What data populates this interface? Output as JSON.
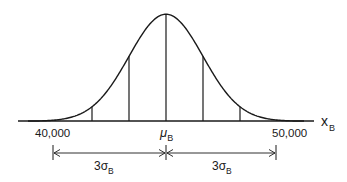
{
  "figure": {
    "type": "normal-distribution-diagram",
    "colors": {
      "stroke": "#1a1a1a",
      "background": "#ffffff"
    },
    "axis": {
      "variable": "x",
      "variable_subscript": "B"
    },
    "tick_labels": {
      "left": "40,000",
      "center_symbol": "μ",
      "center_subscript": "B",
      "right": "50,000"
    },
    "dimensions": [
      {
        "label_prefix": "3σ",
        "label_subscript": "B",
        "side": "left"
      },
      {
        "label_prefix": "3σ",
        "label_subscript": "B",
        "side": "right"
      }
    ],
    "vertical_lines_sigma": [
      -3,
      -2,
      -1,
      0,
      1,
      2,
      3
    ]
  },
  "chart_data": {
    "type": "line",
    "title": "",
    "xlabel": "x_B",
    "ylabel": "",
    "mean_label": "μ_B",
    "mean_value": 45000,
    "sigma_value": 1666.67,
    "x_ticks": [
      {
        "value": 40000,
        "label": "40,000",
        "sigma": -3
      },
      {
        "value": 45000,
        "label": "μ_B",
        "sigma": 0
      },
      {
        "value": 50000,
        "label": "50,000",
        "sigma": 3
      }
    ],
    "annotations": [
      {
        "text": "3σ_B",
        "from": 40000,
        "to": 45000
      },
      {
        "text": "3σ_B",
        "from": 45000,
        "to": 50000
      }
    ],
    "vertical_lines_at_sigma": [
      -3,
      -2,
      -1,
      0,
      1,
      2,
      3
    ],
    "grid": false,
    "legend": "none"
  }
}
